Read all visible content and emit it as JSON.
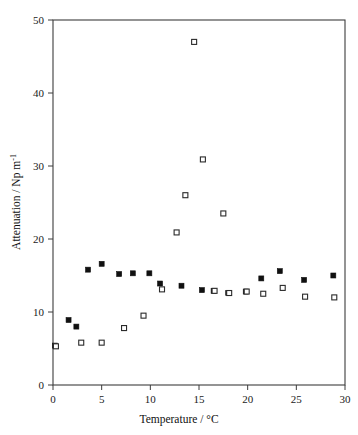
{
  "figure": {
    "background_color": "#ffffff",
    "frame_color": "#3c3c3c",
    "text_color": "#111111"
  },
  "axis_labels": {
    "x_title": "Temperature / ",
    "x_units": "°C",
    "y_title": "Attenuation / Np m",
    "y_exponent": "-1"
  },
  "ticks": {
    "x": [
      "0",
      "5",
      "10",
      "15",
      "20",
      "25",
      "30"
    ],
    "y": [
      "0",
      "10",
      "20",
      "30",
      "40",
      "50"
    ]
  },
  "chart_data": {
    "type": "scatter",
    "title": "",
    "xlabel": "Temperature / °C",
    "ylabel": "Attenuation / Np m-1",
    "xlim": [
      0,
      30
    ],
    "ylim": [
      0,
      50
    ],
    "xticks": [
      0,
      5,
      10,
      15,
      20,
      25,
      30
    ],
    "yticks": [
      0,
      10,
      20,
      30,
      40,
      50
    ],
    "grid": false,
    "legend": "none",
    "marker_size_px": 5,
    "series": [
      {
        "name": "filled-squares",
        "marker": "filled-square",
        "color": "#101010",
        "points": [
          [
            0.2,
            5.4
          ],
          [
            1.6,
            8.9
          ],
          [
            2.4,
            8.0
          ],
          [
            3.6,
            15.8
          ],
          [
            5.0,
            16.6
          ],
          [
            6.8,
            15.2
          ],
          [
            8.2,
            15.3
          ],
          [
            9.9,
            15.3
          ],
          [
            11.0,
            13.9
          ],
          [
            13.2,
            13.6
          ],
          [
            15.3,
            13.0
          ],
          [
            16.5,
            12.9
          ],
          [
            18.0,
            12.6
          ],
          [
            19.8,
            12.8
          ],
          [
            21.4,
            14.6
          ],
          [
            23.3,
            15.6
          ],
          [
            25.8,
            14.4
          ],
          [
            28.8,
            15.0
          ]
        ]
      },
      {
        "name": "open-squares",
        "marker": "open-square",
        "color": "#2a2a2a",
        "points": [
          [
            0.3,
            5.3
          ],
          [
            2.9,
            5.8
          ],
          [
            5.0,
            5.8
          ],
          [
            7.3,
            7.8
          ],
          [
            9.3,
            9.5
          ],
          [
            11.2,
            13.1
          ],
          [
            12.7,
            20.9
          ],
          [
            13.6,
            26.0
          ],
          [
            14.5,
            47.0
          ],
          [
            15.4,
            30.9
          ],
          [
            17.5,
            23.5
          ],
          [
            16.6,
            12.9
          ],
          [
            18.1,
            12.6
          ],
          [
            19.9,
            12.8
          ],
          [
            21.6,
            12.5
          ],
          [
            23.6,
            13.3
          ],
          [
            25.9,
            12.1
          ],
          [
            28.9,
            12.0
          ]
        ]
      }
    ]
  }
}
